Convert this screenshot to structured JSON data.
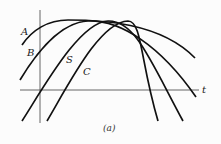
{
  "figure": {
    "caption": "(a)",
    "axis_label_t": "t",
    "colors": {
      "curve": "#111111",
      "axis": "#555555",
      "background": "#fcfcfc"
    },
    "curves": [
      {
        "label": "A",
        "description": "leftmost phase-shifted sinusoid"
      },
      {
        "label": "B",
        "description": "second phase-shifted sinusoid"
      },
      {
        "label": "S",
        "description": "third phase-shifted sinusoid"
      },
      {
        "label": "C",
        "description": "rightmost phase-shifted sinusoid"
      }
    ]
  }
}
